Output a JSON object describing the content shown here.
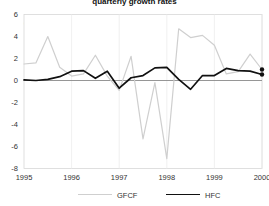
{
  "chart_data": {
    "type": "line",
    "title": "quarterly growth rates",
    "units_label": "(%)",
    "xlabel": "",
    "ylabel": "",
    "ylim": [
      -8,
      6
    ],
    "yticks": [
      6,
      4,
      2,
      0,
      -2,
      -4,
      -6,
      -8
    ],
    "xlim": [
      1995.0,
      2000.0
    ],
    "xticks": [
      1995,
      1996,
      1997,
      1998,
      1999,
      2000
    ],
    "xtick_labels": [
      "1995",
      "1996",
      "1997",
      "1998",
      "1999",
      "2000"
    ],
    "grid": false,
    "zero_line": true,
    "legend_position": "bottom",
    "x": [
      1995.0,
      1995.25,
      1995.5,
      1995.75,
      1996.0,
      1996.25,
      1996.5,
      1996.75,
      1997.0,
      1997.25,
      1997.5,
      1997.75,
      1998.0,
      1998.25,
      1998.5,
      1998.75,
      1999.0,
      1999.25,
      1999.5,
      1999.75,
      2000.0
    ],
    "series": [
      {
        "name": "GFCF",
        "color": "#cfcfcf",
        "end_marker": true,
        "end_marker_color": "#111111",
        "values": [
          1.5,
          1.6,
          4.0,
          1.2,
          0.4,
          0.6,
          2.3,
          0.4,
          -0.9,
          2.2,
          -5.3,
          -0.2,
          -7.1,
          4.7,
          3.9,
          4.1,
          3.2,
          0.6,
          0.8,
          2.4,
          1.0
        ]
      },
      {
        "name": "HFC",
        "color": "#111111",
        "end_marker": true,
        "end_marker_color": "#111111",
        "values": [
          0.05,
          0.0,
          0.1,
          0.35,
          0.85,
          0.9,
          0.2,
          0.85,
          -0.7,
          0.25,
          0.45,
          1.15,
          1.2,
          0.1,
          -0.8,
          0.45,
          0.45,
          1.1,
          0.9,
          0.85,
          0.55
        ]
      }
    ]
  },
  "legend": {
    "items": [
      {
        "label": "GFCF",
        "key": "gfcf"
      },
      {
        "label": "HFC",
        "key": "hfc"
      }
    ]
  }
}
